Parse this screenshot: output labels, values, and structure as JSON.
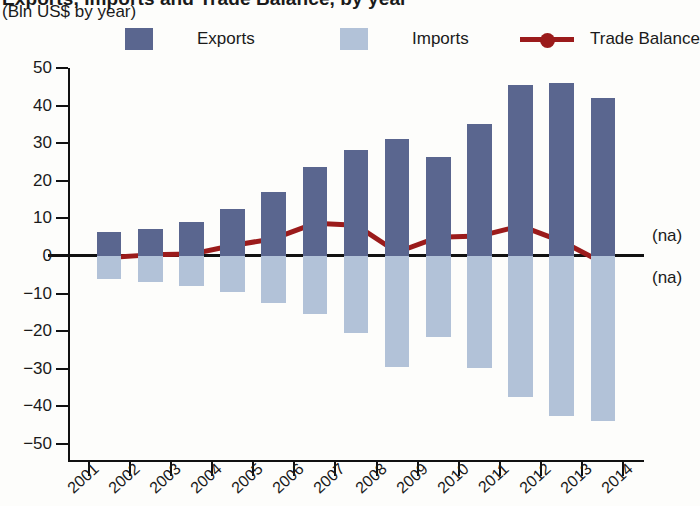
{
  "header": {
    "title": "Exports, Imports and Trade Balance, by year",
    "subtitle": "(Bln US$ by year)"
  },
  "legend": {
    "position": "top",
    "items": [
      {
        "label": "Exports",
        "icon": "square-swatch",
        "color": "#5a668f"
      },
      {
        "label": "Imports",
        "icon": "square-swatch",
        "color": "#b2c2d8"
      },
      {
        "label": "Trade Balance",
        "icon": "line-marker",
        "color": "#9b1b1b"
      }
    ]
  },
  "annotations": [
    {
      "name": "na-upper",
      "text": "(na)"
    },
    {
      "name": "na-lower",
      "text": "(na)"
    }
  ],
  "chart_data": {
    "type": "bar",
    "title": "Exports, Imports and Trade Balance, by year",
    "subtitle": "(Bln US$ by year)",
    "xlabel": "",
    "ylabel": "",
    "ylim": [
      -50,
      50
    ],
    "yticks": [
      50,
      40,
      30,
      20,
      10,
      0,
      -10,
      -20,
      -30,
      -40,
      -50
    ],
    "ytick_labels": [
      "50",
      "40",
      "30",
      "20",
      "10",
      "0",
      "−10",
      "−20",
      "−30",
      "−40",
      "−50"
    ],
    "grid": false,
    "xticks": [
      "2001",
      "2002",
      "2003",
      "2004",
      "2005",
      "2006",
      "2007",
      "2008",
      "2009",
      "2010",
      "2011",
      "2012",
      "2013",
      "2014"
    ],
    "categories": [
      "2001",
      "2002",
      "2003",
      "2004",
      "2005",
      "2006",
      "2007",
      "2008",
      "2009",
      "2010",
      "2011",
      "2012",
      "2013"
    ],
    "series": [
      {
        "name": "Exports",
        "type": "bar",
        "color": "#5a668f",
        "values": [
          6.5,
          7.3,
          9.0,
          12.6,
          17.0,
          23.6,
          28.2,
          31.2,
          26.4,
          35.2,
          45.6,
          45.9,
          41.9
        ]
      },
      {
        "name": "Imports",
        "type": "bar",
        "color": "#b2c2d8",
        "values": [
          -6.2,
          -6.8,
          -8.0,
          -9.6,
          -12.5,
          -15.3,
          -20.5,
          -29.6,
          -21.5,
          -29.9,
          -37.5,
          -42.6,
          -43.9
        ]
      },
      {
        "name": "Trade Balance",
        "type": "line",
        "color": "#9b1b1b",
        "values": [
          -0.4,
          0.3,
          0.5,
          2.8,
          4.6,
          8.7,
          8.2,
          1.0,
          5.0,
          5.3,
          8.0,
          3.9,
          -1.8
        ]
      }
    ]
  }
}
